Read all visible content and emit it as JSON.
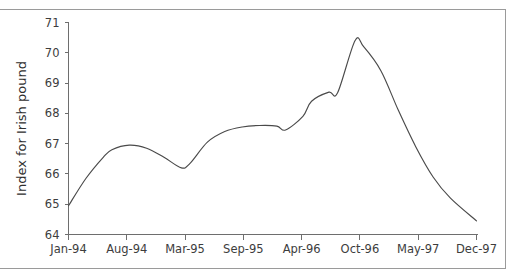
{
  "chart_data": {
    "type": "line",
    "title": "",
    "xlabel": "",
    "ylabel": "Index for Irish pound",
    "ylim": [
      64,
      71
    ],
    "ytick_labels": [
      "64",
      "65",
      "66",
      "67",
      "68",
      "69",
      "70",
      "71"
    ],
    "ytick_values": [
      64,
      65,
      66,
      67,
      68,
      69,
      70,
      71
    ],
    "xtick_labels": [
      "Jan-94",
      "Aug-94",
      "Mar-95",
      "Sep-95",
      "Apr-96",
      "Oct-96",
      "May-97",
      "Dec-97"
    ],
    "grid": false,
    "legend": "none",
    "line_color": "#4a4a4a",
    "axis_color": "#6e6e6e",
    "series": [
      {
        "name": "Index for Irish pound",
        "x": [
          "Jan-94",
          "Mar-94",
          "May-94",
          "Jun-94",
          "Aug-94",
          "Oct-94",
          "Dec-94",
          "Feb-95",
          "Mar-95",
          "May-95",
          "Jul-95",
          "Sep-95",
          "Nov-95",
          "Jan-96",
          "Feb-96",
          "Apr-96",
          "May-96",
          "Jul-96",
          "Aug-96",
          "Oct-96",
          "Nov-96",
          "Jan-97",
          "Mar-97",
          "May-97",
          "Jul-97",
          "Sep-97",
          "Dec-97"
        ],
        "values": [
          64.95,
          65.85,
          66.55,
          66.8,
          66.95,
          66.85,
          66.55,
          66.2,
          66.35,
          67.05,
          67.4,
          67.55,
          67.6,
          67.58,
          67.45,
          67.9,
          68.4,
          68.7,
          68.68,
          70.4,
          70.2,
          69.4,
          68.1,
          66.9,
          65.9,
          65.2,
          64.45
        ]
      }
    ]
  },
  "axes": {
    "y_label_text": "Index for Irish pound"
  }
}
